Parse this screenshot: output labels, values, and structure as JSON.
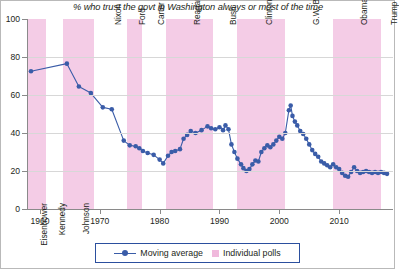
{
  "chart_data": {
    "type": "line",
    "title": "% who trust the govt in Washington always or most of the time",
    "xlabel": "",
    "ylabel": "",
    "xlim": [
      1958,
      2019
    ],
    "ylim": [
      0,
      100
    ],
    "yticks": [
      0,
      20,
      40,
      60,
      80,
      100
    ],
    "xticks": [
      1960,
      1970,
      1980,
      1990,
      2000,
      2010
    ],
    "grid": "horizontal",
    "legend_position": "bottom-center",
    "series": [
      {
        "name": "Moving average",
        "color": "#3a5ca8",
        "marker": "circle",
        "points": [
          [
            1958.5,
            72.5
          ],
          [
            1964.5,
            76.5
          ],
          [
            1966.5,
            64.5
          ],
          [
            1968.5,
            61.0
          ],
          [
            1970.5,
            53.5
          ],
          [
            1972.0,
            52.5
          ],
          [
            1974.0,
            36.0
          ],
          [
            1975.0,
            33.5
          ],
          [
            1976.0,
            33.0
          ],
          [
            1976.6,
            32.0
          ],
          [
            1977.2,
            30.5
          ],
          [
            1978.0,
            29.5
          ],
          [
            1979.0,
            28.5
          ],
          [
            1980.0,
            26.0
          ],
          [
            1980.6,
            24.0
          ],
          [
            1981.4,
            28.0
          ],
          [
            1982.0,
            30.0
          ],
          [
            1982.6,
            30.5
          ],
          [
            1983.4,
            31.5
          ],
          [
            1984.0,
            37.0
          ],
          [
            1984.6,
            39.0
          ],
          [
            1985.2,
            41.0
          ],
          [
            1986.0,
            40.0
          ],
          [
            1987.0,
            41.5
          ],
          [
            1988.0,
            43.5
          ],
          [
            1988.6,
            42.5
          ],
          [
            1989.3,
            42.0
          ],
          [
            1990.0,
            43.0
          ],
          [
            1990.6,
            41.5
          ],
          [
            1991.0,
            44.0
          ],
          [
            1991.5,
            42.0
          ],
          [
            1992.0,
            34.0
          ],
          [
            1992.5,
            30.0
          ],
          [
            1993.0,
            26.5
          ],
          [
            1993.6,
            23.5
          ],
          [
            1994.0,
            21.5
          ],
          [
            1994.5,
            20.0
          ],
          [
            1995.0,
            21.0
          ],
          [
            1995.5,
            23.5
          ],
          [
            1996.0,
            25.5
          ],
          [
            1996.5,
            25.0
          ],
          [
            1997.0,
            30.0
          ],
          [
            1997.5,
            32.0
          ],
          [
            1998.0,
            33.5
          ],
          [
            1998.5,
            32.5
          ],
          [
            1999.0,
            34.0
          ],
          [
            1999.5,
            36.0
          ],
          [
            2000.0,
            38.0
          ],
          [
            2000.5,
            37.0
          ],
          [
            2001.0,
            40.0
          ],
          [
            2001.6,
            52.0
          ],
          [
            2001.9,
            54.5
          ],
          [
            2002.2,
            49.0
          ],
          [
            2002.6,
            46.0
          ],
          [
            2003.0,
            44.0
          ],
          [
            2003.5,
            41.0
          ],
          [
            2004.0,
            39.5
          ],
          [
            2004.5,
            37.0
          ],
          [
            2005.0,
            34.0
          ],
          [
            2005.5,
            31.0
          ],
          [
            2006.0,
            29.0
          ],
          [
            2006.5,
            27.5
          ],
          [
            2007.0,
            25.0
          ],
          [
            2007.5,
            24.0
          ],
          [
            2008.0,
            23.0
          ],
          [
            2008.5,
            22.0
          ],
          [
            2009.0,
            23.5
          ],
          [
            2009.5,
            22.0
          ],
          [
            2010.0,
            21.0
          ],
          [
            2010.5,
            19.0
          ],
          [
            2011.0,
            17.5
          ],
          [
            2011.5,
            17.0
          ],
          [
            2012.0,
            19.5
          ],
          [
            2012.5,
            22.0
          ],
          [
            2013.0,
            20.0
          ],
          [
            2013.5,
            19.0
          ],
          [
            2014.0,
            19.5
          ],
          [
            2014.5,
            20.0
          ],
          [
            2015.0,
            19.5
          ],
          [
            2015.5,
            19.0
          ],
          [
            2016.0,
            19.5
          ],
          [
            2016.5,
            19.0
          ],
          [
            2017.0,
            19.5
          ],
          [
            2017.5,
            19.0
          ],
          [
            2018.0,
            18.5
          ]
        ]
      }
    ],
    "presidents": [
      {
        "name": "Eisenhower",
        "start": 1958.0,
        "end": 1961.0,
        "shaded": true,
        "align": "bottom"
      },
      {
        "name": "Kennedy",
        "start": 1961.0,
        "end": 1963.9,
        "shaded": false,
        "align": "bottom"
      },
      {
        "name": "Johnson",
        "start": 1963.9,
        "end": 1969.0,
        "shaded": true,
        "align": "bottom"
      },
      {
        "name": "Nixon",
        "start": 1969.0,
        "end": 1974.6,
        "shaded": false,
        "align": "top"
      },
      {
        "name": "Ford",
        "start": 1974.6,
        "end": 1977.0,
        "shaded": true,
        "align": "top"
      },
      {
        "name": "Carter",
        "start": 1977.0,
        "end": 1981.0,
        "shaded": false,
        "align": "top"
      },
      {
        "name": "Reagan",
        "start": 1981.0,
        "end": 1989.0,
        "shaded": true,
        "align": "top"
      },
      {
        "name": "Bush",
        "start": 1989.0,
        "end": 1993.0,
        "shaded": false,
        "align": "top"
      },
      {
        "name": "Clinton",
        "start": 1993.0,
        "end": 2001.0,
        "shaded": true,
        "align": "top"
      },
      {
        "name": "G.W. Bush",
        "start": 2001.0,
        "end": 2009.0,
        "shaded": false,
        "align": "top"
      },
      {
        "name": "Obama",
        "start": 2009.0,
        "end": 2017.0,
        "shaded": true,
        "align": "top"
      },
      {
        "name": "Trump",
        "start": 2017.0,
        "end": 2019.0,
        "shaded": false,
        "align": "top"
      }
    ],
    "legend": [
      {
        "label": "Moving average",
        "type": "line-marker",
        "color": "#3a5ca8"
      },
      {
        "label": "Individual polls",
        "type": "swatch",
        "color": "#f0b9dc"
      }
    ]
  }
}
